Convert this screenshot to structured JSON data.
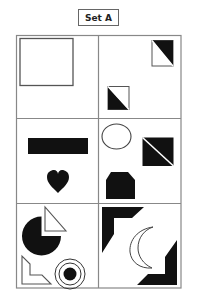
{
  "title": "Set A",
  "grid": {
    "rows": 3,
    "cols": 2,
    "border_color": "#888888",
    "fill_color": "#111111",
    "cells": [
      {
        "row": 1,
        "col": 1,
        "shapes": [
          "large outlined square"
        ]
      },
      {
        "row": 1,
        "col": 2,
        "shapes": [
          "diagonally split square (black top-right)",
          "diagonally split square (black bottom-left)"
        ]
      },
      {
        "row": 2,
        "col": 1,
        "shapes": [
          "black rectangle",
          "black heart"
        ]
      },
      {
        "row": 2,
        "col": 2,
        "shapes": [
          "outlined ellipse",
          "diagonally split black square",
          "black octagon-top block"
        ]
      },
      {
        "row": 3,
        "col": 1,
        "shapes": [
          "black pac-man circle",
          "outlined triangle",
          "outlined L-shape",
          "concentric circles target"
        ]
      },
      {
        "row": 3,
        "col": 2,
        "shapes": [
          "black corner chevron top-left",
          "outlined crescent moon",
          "black corner chevron bottom-right"
        ]
      }
    ]
  }
}
